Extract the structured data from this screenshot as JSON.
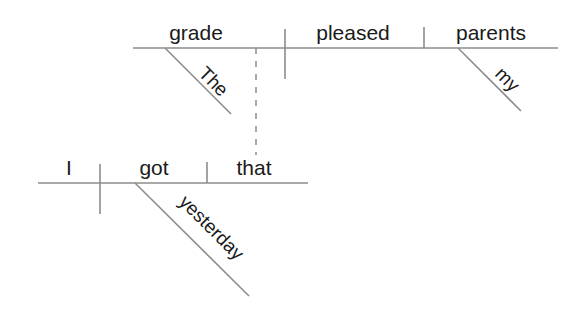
{
  "figure": {
    "sentence": "The grade I got yesterday pleased my parents.",
    "background_color": "#ffffff",
    "line_color": "#8d8d8d",
    "text_color": "#1a1a1a"
  },
  "main_clause": {
    "subject": "grade",
    "verb": "pleased",
    "object": "parents",
    "subject_modifier": "The",
    "object_modifier": "my"
  },
  "subordinate_clause": {
    "subject": "I",
    "verb": "got",
    "object": "that",
    "verb_modifier": "yesterday"
  },
  "connector": {
    "style": "dashed",
    "label": ""
  }
}
